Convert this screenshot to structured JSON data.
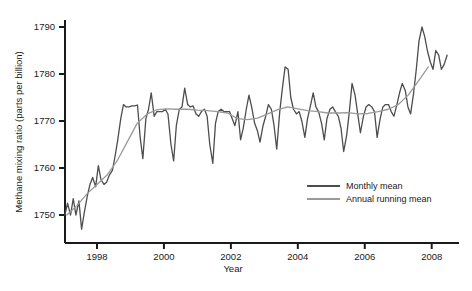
{
  "chart_data": {
    "type": "line",
    "title": "",
    "xlabel": "Year",
    "ylabel": "Methane mixing ratio (parts per billion)",
    "xlim": [
      1997.0,
      2008.8
    ],
    "ylim": [
      1744.0,
      1792.0
    ],
    "xticks": [
      1998,
      2000,
      2002,
      2004,
      2006,
      2008
    ],
    "xtick_labels": [
      "1998",
      "2000",
      "2002",
      "2004",
      "2006",
      "2008"
    ],
    "yticks": [
      1750,
      1760,
      1770,
      1780,
      1790
    ],
    "ytick_labels": [
      "1750",
      "1760",
      "1770",
      "1780",
      "1790"
    ],
    "grid": false,
    "legend_position": "center-right",
    "series": [
      {
        "name": "Monthly mean",
        "color": "#4d4d4d",
        "linewidth": 1.3,
        "x": [
          1997.04,
          1997.12,
          1997.21,
          1997.29,
          1997.37,
          1997.46,
          1997.54,
          1997.62,
          1997.71,
          1997.79,
          1997.87,
          1997.96,
          1998.04,
          1998.12,
          1998.21,
          1998.29,
          1998.37,
          1998.46,
          1998.54,
          1998.62,
          1998.71,
          1998.79,
          1998.87,
          1998.96,
          1999.04,
          1999.12,
          1999.21,
          1999.29,
          1999.37,
          1999.46,
          1999.54,
          1999.62,
          1999.71,
          1999.79,
          1999.87,
          1999.96,
          2000.04,
          2000.12,
          2000.21,
          2000.29,
          2000.37,
          2000.46,
          2000.54,
          2000.62,
          2000.71,
          2000.79,
          2000.87,
          2000.96,
          2001.04,
          2001.12,
          2001.21,
          2001.29,
          2001.37,
          2001.46,
          2001.54,
          2001.62,
          2001.71,
          2001.79,
          2001.87,
          2001.96,
          2002.04,
          2002.12,
          2002.21,
          2002.29,
          2002.37,
          2002.46,
          2002.54,
          2002.62,
          2002.71,
          2002.79,
          2002.87,
          2002.96,
          2003.04,
          2003.12,
          2003.21,
          2003.29,
          2003.37,
          2003.46,
          2003.54,
          2003.62,
          2003.71,
          2003.79,
          2003.87,
          2003.96,
          2004.04,
          2004.12,
          2004.21,
          2004.29,
          2004.37,
          2004.46,
          2004.54,
          2004.62,
          2004.71,
          2004.79,
          2004.87,
          2004.96,
          2005.04,
          2005.12,
          2005.21,
          2005.29,
          2005.37,
          2005.46,
          2005.54,
          2005.62,
          2005.71,
          2005.79,
          2005.87,
          2005.96,
          2006.04,
          2006.12,
          2006.21,
          2006.29,
          2006.37,
          2006.46,
          2006.54,
          2006.62,
          2006.71,
          2006.79,
          2006.87,
          2006.96,
          2007.04,
          2007.12,
          2007.21,
          2007.29,
          2007.37,
          2007.46,
          2007.54,
          2007.62,
          2007.71,
          2007.79,
          2007.87,
          2007.96,
          2008.04,
          2008.12,
          2008.21,
          2008.29,
          2008.37,
          2008.46
        ],
        "y": [
          1750.0,
          1752.5,
          1750.0,
          1753.5,
          1750.0,
          1753.0,
          1747.0,
          1750.5,
          1754.0,
          1756.5,
          1758.0,
          1756.0,
          1760.5,
          1757.5,
          1756.5,
          1757.0,
          1758.5,
          1759.5,
          1762.5,
          1766.0,
          1770.5,
          1773.5,
          1773.0,
          1773.0,
          1773.2,
          1773.2,
          1773.4,
          1766.5,
          1762.0,
          1770.5,
          1772.5,
          1776.0,
          1771.0,
          1772.0,
          1772.0,
          1772.0,
          1772.5,
          1771.5,
          1765.0,
          1761.5,
          1769.0,
          1772.5,
          1773.0,
          1777.0,
          1773.5,
          1773.0,
          1773.2,
          1771.5,
          1771.0,
          1772.0,
          1772.5,
          1771.0,
          1765.0,
          1761.0,
          1769.5,
          1772.0,
          1772.5,
          1772.0,
          1772.0,
          1772.0,
          1770.5,
          1769.0,
          1772.0,
          1766.0,
          1768.5,
          1772.5,
          1775.5,
          1773.0,
          1769.5,
          1768.0,
          1765.5,
          1769.0,
          1771.0,
          1773.5,
          1772.5,
          1769.0,
          1764.0,
          1772.0,
          1777.0,
          1781.5,
          1781.0,
          1775.0,
          1772.5,
          1771.5,
          1772.0,
          1770.0,
          1766.5,
          1770.5,
          1773.0,
          1776.0,
          1773.0,
          1772.0,
          1769.5,
          1766.0,
          1770.5,
          1772.5,
          1773.0,
          1772.0,
          1771.0,
          1768.5,
          1763.5,
          1767.0,
          1772.0,
          1778.0,
          1775.5,
          1771.5,
          1767.5,
          1771.0,
          1773.0,
          1773.5,
          1773.0,
          1772.0,
          1766.5,
          1770.5,
          1773.0,
          1773.5,
          1773.5,
          1772.0,
          1771.0,
          1773.5,
          1776.0,
          1778.0,
          1776.5,
          1773.0,
          1771.5,
          1776.0,
          1781.0,
          1787.0,
          1790.0,
          1788.0,
          1785.0,
          1782.5,
          1781.0,
          1785.0,
          1784.0,
          1781.0,
          1782.0,
          1784.0
        ]
      },
      {
        "name": "Annual running mean",
        "color": "#9a9a9a",
        "linewidth": 1.3,
        "x": [
          1997.1,
          1997.4,
          1997.7,
          1998.0,
          1998.3,
          1998.6,
          1998.9,
          1999.2,
          1999.5,
          1999.8,
          2000.1,
          2000.4,
          2000.7,
          2001.0,
          2001.3,
          2001.6,
          2001.9,
          2002.2,
          2002.5,
          2002.8,
          2003.1,
          2003.4,
          2003.7,
          2004.0,
          2004.3,
          2004.6,
          2004.9,
          2005.2,
          2005.5,
          2005.8,
          2006.1,
          2006.4,
          2006.7,
          2007.0,
          2007.3,
          2007.6,
          2007.9
        ],
        "y": [
          1750.0,
          1752.0,
          1754.5,
          1756.5,
          1758.5,
          1761.5,
          1765.5,
          1769.5,
          1771.5,
          1772.4,
          1772.6,
          1772.5,
          1772.5,
          1772.3,
          1772.2,
          1772.0,
          1771.7,
          1770.5,
          1770.3,
          1770.6,
          1771.5,
          1772.4,
          1773.0,
          1772.6,
          1772.2,
          1772.0,
          1771.7,
          1771.7,
          1771.8,
          1771.5,
          1771.6,
          1772.0,
          1772.5,
          1773.5,
          1775.5,
          1778.5,
          1781.5
        ]
      }
    ]
  },
  "axes": {
    "y_axis_label": "Methane mixing ratio (parts per billion)",
    "x_axis_label": "Year",
    "axis_color": "#1a1a1a"
  },
  "legend": {
    "entries": [
      {
        "label": "Monthly mean",
        "color": "#4d4d4d"
      },
      {
        "label": "Annual running mean",
        "color": "#9a9a9a"
      }
    ]
  }
}
